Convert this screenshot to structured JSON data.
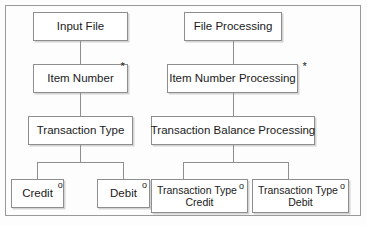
{
  "diagram": {
    "notation": {
      "iteration_marker": "*",
      "selection_marker": "o"
    },
    "colors": {
      "background": "#fdfdfd",
      "box_fill": "#ffffff",
      "border": "#8e8e8e",
      "frame_border": "#9a9a9a",
      "text": "#1a1a1a"
    },
    "left_tree": {
      "root": {
        "label": "Input File",
        "marker": ""
      },
      "level2": {
        "label": "Item Number",
        "marker": "*"
      },
      "level3": {
        "label": "Transaction Type",
        "marker": ""
      },
      "leaves": [
        {
          "label": "Credit",
          "marker": "o"
        },
        {
          "label": "Debit",
          "marker": "o"
        }
      ]
    },
    "right_tree": {
      "root": {
        "label": "File Processing",
        "marker": ""
      },
      "level2": {
        "label": "Item Number Processing",
        "marker": "*"
      },
      "level3": {
        "label": "Transaction Balance Processing",
        "marker": ""
      },
      "leaves": [
        {
          "line1": "Transaction Type",
          "line2": "Credit",
          "marker": "o"
        },
        {
          "line1": "Transaction Type",
          "line2": "Debit",
          "marker": "o"
        }
      ]
    }
  }
}
